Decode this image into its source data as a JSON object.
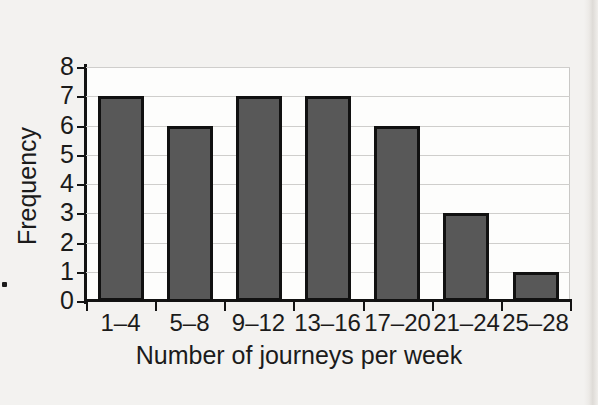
{
  "chart_data": {
    "type": "bar",
    "title": "",
    "subtitle": "",
    "xlabel": "Number of journeys per week",
    "ylabel": "Frequency",
    "categories": [
      "1–4",
      "5–8",
      "9–12",
      "13–16",
      "17–20",
      "21–24",
      "25–28"
    ],
    "values": [
      7,
      6,
      7,
      7,
      6,
      3,
      1
    ],
    "ylim": [
      0,
      8
    ],
    "y_ticks": [
      0,
      1,
      2,
      3,
      4,
      5,
      6,
      7,
      8
    ],
    "y_tick_labels": [
      "0",
      "1",
      "2",
      "3",
      "4",
      "5",
      "6",
      "7",
      "8"
    ],
    "grid": "horizontal",
    "legend": "none",
    "bar_fill_color": "#585858",
    "bar_edge_color": "#111111",
    "gridline_color": "#cfcecc",
    "axis_color": "#131313",
    "plot_background_color": "#fdfdfc",
    "page_background_color": "#f3f2f0"
  },
  "figure": {
    "x_axis_title": "Number of journeys per week",
    "y_axis_title": "Frequency"
  }
}
